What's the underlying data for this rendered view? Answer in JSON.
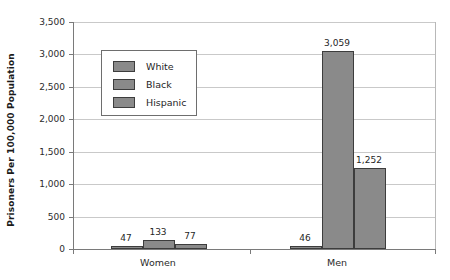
{
  "chart_data": {
    "type": "bar",
    "title": "",
    "xlabel": "",
    "ylabel": "Prisoners Per 100,000 Population",
    "categories": [
      "Women",
      "Men"
    ],
    "series": [
      {
        "name": "White",
        "values": [
          47,
          46
        ]
      },
      {
        "name": "Black",
        "values": [
          133,
          3059
        ]
      },
      {
        "name": "Hispanic",
        "values": [
          77,
          1252
        ]
      }
    ],
    "value_labels": [
      [
        "47",
        "46"
      ],
      [
        "133",
        "3,059"
      ],
      [
        "77",
        "1,252"
      ]
    ],
    "ylim": [
      0,
      3500
    ],
    "y_ticks": [
      0,
      500,
      1000,
      1500,
      2000,
      2500,
      3000,
      3500
    ],
    "y_tick_labels": [
      "0",
      "500",
      "1,000",
      "1,500",
      "2,000",
      "2,500",
      "3,000",
      "3,500"
    ],
    "grid": true,
    "legend_position": "upper-left-inside",
    "series_colors": [
      "#8a8a8a",
      "#8a8a8a",
      "#8a8a8a"
    ],
    "bar_border_color": "#3d3d3d",
    "gridline_color": "#c9c9c9",
    "axis_color": "#7a7a7a"
  },
  "legend": {
    "entries": [
      {
        "label": "White"
      },
      {
        "label": "Black"
      },
      {
        "label": "Hispanic"
      }
    ]
  },
  "axes": {
    "y_title": "Prisoners Per 100,000 Population",
    "x_categories": [
      {
        "label": "Women"
      },
      {
        "label": "Men"
      }
    ]
  }
}
